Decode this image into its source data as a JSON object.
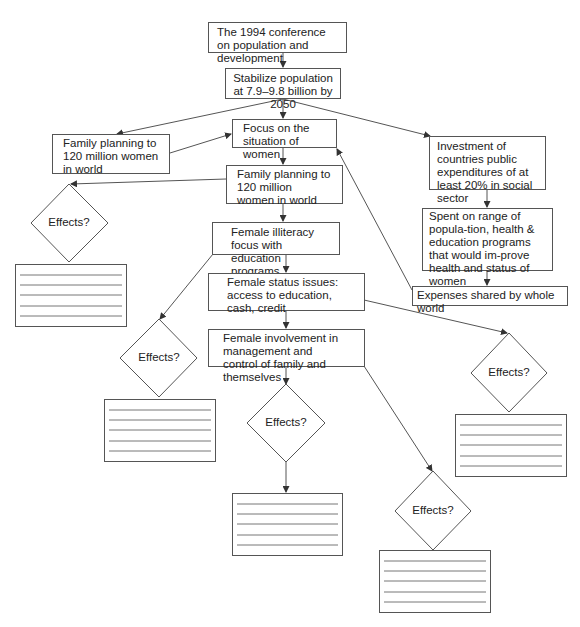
{
  "diagram": {
    "nodes": {
      "conference": "The 1994 conference on population and development",
      "stabilize": "Stabilize population at 7.9–9.8 billion by 2050",
      "family_planning_left": "Family planning to 120 million women in world",
      "focus_women": "Focus on the situation of women",
      "family_planning_center": "Family planning to 120 million women in world",
      "investment": "Investment of countries public expenditures of at least 20% in social sector",
      "spent_range": "Spent on range of popula-tion, health & education programs that would im-prove health and status of women",
      "expenses_shared": "Expenses shared by whole world",
      "female_illiteracy": "Female illiteracy focus with education programs",
      "female_status": "Female status issues: access to education, cash, credit",
      "female_involvement": "Female involvement in management and control of family and themselves"
    },
    "decisions": [
      {
        "label": "Effects?"
      },
      {
        "label": "Effects?"
      },
      {
        "label": "Effects?"
      },
      {
        "label": "Effects?"
      },
      {
        "label": "Effects?"
      }
    ],
    "edges": [
      [
        "conference",
        "stabilize"
      ],
      [
        "stabilize",
        "family_planning_left"
      ],
      [
        "stabilize",
        "focus_women"
      ],
      [
        "stabilize",
        "investment"
      ],
      [
        "family_planning_left",
        "focus_women"
      ],
      [
        "focus_women",
        "family_planning_center"
      ],
      [
        "family_planning_center",
        "decision_1"
      ],
      [
        "family_planning_center",
        "female_illiteracy"
      ],
      [
        "female_illiteracy",
        "decision_2"
      ],
      [
        "female_illiteracy",
        "female_status"
      ],
      [
        "female_status",
        "decision_4"
      ],
      [
        "female_status",
        "female_involvement"
      ],
      [
        "female_involvement",
        "decision_3"
      ],
      [
        "female_involvement",
        "decision_5"
      ],
      [
        "investment",
        "spent_range"
      ],
      [
        "spent_range",
        "expenses_shared"
      ],
      [
        "expenses_shared",
        "focus_women"
      ],
      [
        "decision_3",
        "answer_box_3"
      ]
    ]
  }
}
